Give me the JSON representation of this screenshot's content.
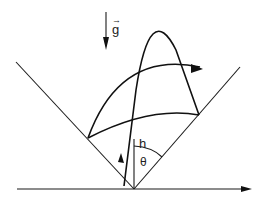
{
  "diagram": {
    "labels": {
      "gravity": "g",
      "height": "h",
      "angle": "θ"
    },
    "gravity_vector_marker": "→",
    "colors": {
      "stroke": "#111111",
      "background": "#ffffff"
    }
  }
}
